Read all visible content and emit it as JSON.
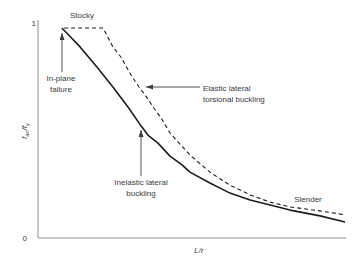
{
  "figure": {
    "background": "#ffffff",
    "colors": {
      "curve": "#1c1c1c",
      "axis": "#8f8f8f",
      "annotation": "#3c3c3c",
      "text": "#3a3a3a"
    }
  },
  "chart_data": {
    "type": "line",
    "title": "",
    "xlabel": "L/r",
    "ylabel": "fac/fy",
    "ylabel_parts": {
      "sym1": "f",
      "sub1": "ac",
      "sym2": "/f",
      "sub2": "y"
    },
    "xlim": [
      0,
      100
    ],
    "ylim": [
      0,
      1
    ],
    "grid": false,
    "legend": "none",
    "x_ticks": [],
    "y_ticks": [
      {
        "value": 1,
        "label": "1"
      },
      {
        "value": 0,
        "label": "0"
      }
    ],
    "series": [
      {
        "name": "in-plane / inelastic lateral buckling (solid)",
        "style": "solid",
        "points": [
          [
            7.8,
            1.0
          ],
          [
            13.7,
            0.91
          ],
          [
            19.2,
            0.814
          ],
          [
            24.4,
            0.719
          ],
          [
            29.3,
            0.624
          ],
          [
            33.6,
            0.533
          ],
          [
            35.8,
            0.49
          ],
          [
            39.1,
            0.452
          ],
          [
            43.0,
            0.39
          ],
          [
            46.9,
            0.348
          ],
          [
            49.5,
            0.314
          ],
          [
            56.0,
            0.262
          ],
          [
            62.5,
            0.214
          ],
          [
            69.1,
            0.181
          ],
          [
            75.6,
            0.157
          ],
          [
            82.1,
            0.133
          ],
          [
            91.9,
            0.105
          ],
          [
            100.0,
            0.076
          ]
        ]
      },
      {
        "name": "elastic lateral torsional buckling (dashed)",
        "style": "dashed",
        "points": [
          [
            8.5,
            1.0
          ],
          [
            21.2,
            1.0
          ],
          [
            24.4,
            0.91
          ],
          [
            27.0,
            0.862
          ],
          [
            30.3,
            0.776
          ],
          [
            32.9,
            0.719
          ],
          [
            34.9,
            0.681
          ],
          [
            37.5,
            0.624
          ],
          [
            40.1,
            0.571
          ],
          [
            43.0,
            0.5
          ],
          [
            49.5,
            0.395
          ],
          [
            56.0,
            0.314
          ],
          [
            62.5,
            0.252
          ],
          [
            69.1,
            0.205
          ],
          [
            75.6,
            0.171
          ],
          [
            82.1,
            0.148
          ],
          [
            91.9,
            0.129
          ],
          [
            100.0,
            0.11
          ]
        ]
      }
    ],
    "annotations": {
      "stocky": {
        "label": "Stocky"
      },
      "in_plane_failure": {
        "line1": "In-plane",
        "line2": "failure"
      },
      "elastic_ltb": {
        "line1": "Elastic lateral",
        "line2": "torsional buckling"
      },
      "inelastic_ltb": {
        "line1": "Inelastic lateral",
        "line2": "buckling"
      },
      "slender": {
        "label": "Slender"
      }
    }
  }
}
